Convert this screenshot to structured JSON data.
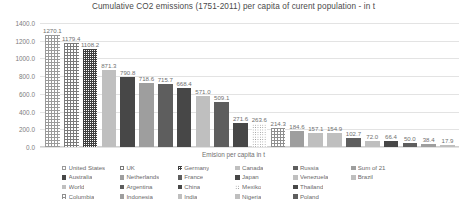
{
  "chart_data": {
    "type": "bar",
    "title": "Cumulative CO2 emissions (1751-2011) per capita of curent population - in t",
    "xlabel": "Emision per capita in t",
    "ylabel": "",
    "ylim": [
      0,
      1400
    ],
    "ytick_step": 200,
    "grid": true,
    "legend_position": "bottom",
    "ytick_labels": [
      "1400.0",
      "1200.0",
      "1000.0",
      "800.0",
      "600.0",
      "400.0",
      "200.0",
      "0.0"
    ],
    "categories": [
      "United States",
      "UK",
      "Germany",
      "Canada",
      "Australia",
      "Netherlands",
      "France",
      "Japan",
      "World",
      "Argentina",
      "China",
      "Mexiko",
      "Columbia",
      "Indonesia",
      "India",
      "Nigeria",
      "Russia",
      "Venezuela",
      "Thailand",
      "Poland",
      "Sum of 21",
      "Brazil"
    ],
    "values": [
      1270.1,
      1179.4,
      1108.2,
      871.3,
      790.8,
      718.6,
      715.7,
      668.4,
      571.0,
      509.1,
      271.6,
      263.6,
      214.3,
      184.6,
      157.1,
      154.9,
      102.7,
      72.0,
      66.4,
      50.0,
      38.4,
      17.9
    ],
    "bars": [
      {
        "label": "1270.1",
        "value": 1270.1,
        "fill": "f-grid-light"
      },
      {
        "label": "1179.4",
        "value": 1179.4,
        "fill": "f-grid-mid"
      },
      {
        "label": "1108.2",
        "value": 1108.2,
        "fill": "f-grid-dark"
      },
      {
        "label": "871.3",
        "value": 871.3,
        "fill": "f-solid-light"
      },
      {
        "label": "790.8",
        "value": 790.8,
        "fill": "f-solid-xdark"
      },
      {
        "label": "718.6",
        "value": 718.6,
        "fill": "f-solid-mid"
      },
      {
        "label": "715.7",
        "value": 715.7,
        "fill": "f-solid-dark"
      },
      {
        "label": "668.4",
        "value": 668.4,
        "fill": "f-solid-xdark"
      },
      {
        "label": "571.0",
        "value": 571.0,
        "fill": "f-solid-light"
      },
      {
        "label": "509.1",
        "value": 509.1,
        "fill": "f-solid-dark"
      },
      {
        "label": "271.6",
        "value": 271.6,
        "fill": "f-solid-xdark"
      },
      {
        "label": "263.6",
        "value": 263.6,
        "fill": "f-dots"
      },
      {
        "label": "214.3",
        "value": 214.3,
        "fill": "f-grid-fine"
      },
      {
        "label": "184.6",
        "value": 184.6,
        "fill": "f-solid-mid"
      },
      {
        "label": "157.1",
        "value": 157.1,
        "fill": "f-solid-light"
      },
      {
        "label": "154.9",
        "value": 154.9,
        "fill": "f-solid-light"
      },
      {
        "label": "102.7",
        "value": 102.7,
        "fill": "f-solid-dark"
      },
      {
        "label": "72.0",
        "value": 72.0,
        "fill": "f-solid-light"
      },
      {
        "label": "66.4",
        "value": 66.4,
        "fill": "f-solid-xdark"
      },
      {
        "label": "50.0",
        "value": 50.0,
        "fill": "f-solid-dark"
      },
      {
        "label": "38.4",
        "value": 38.4,
        "fill": "f-solid-mid"
      },
      {
        "label": "17.9",
        "value": 17.9,
        "fill": "f-solid-light"
      }
    ],
    "legend": [
      {
        "label": "United States",
        "fill": "f-grid-light"
      },
      {
        "label": "Australia",
        "fill": "f-solid-xdark"
      },
      {
        "label": "World",
        "fill": "f-solid-light"
      },
      {
        "label": "Columbia",
        "fill": "f-grid-fine"
      },
      {
        "label": "UK",
        "fill": "f-grid-mid"
      },
      {
        "label": "Netherlands",
        "fill": "f-solid-mid"
      },
      {
        "label": "Argentina",
        "fill": "f-solid-dark"
      },
      {
        "label": "Indonesia",
        "fill": "f-solid-mid"
      },
      {
        "label": "Germany",
        "fill": "f-grid-dark"
      },
      {
        "label": "France",
        "fill": "f-solid-dark"
      },
      {
        "label": "China",
        "fill": "f-solid-xdark"
      },
      {
        "label": "India",
        "fill": "f-solid-light"
      },
      {
        "label": "Canada",
        "fill": "f-solid-light"
      },
      {
        "label": "Japan",
        "fill": "f-solid-xdark"
      },
      {
        "label": "Mexiko",
        "fill": "f-dots"
      },
      {
        "label": "Nigeria",
        "fill": "f-solid-light"
      },
      {
        "label": "Russia",
        "fill": "f-solid-dark"
      },
      {
        "label": "Venezuela",
        "fill": "f-solid-light"
      },
      {
        "label": "Thailand",
        "fill": "f-solid-xdark"
      },
      {
        "label": "Poland",
        "fill": "f-solid-dark"
      },
      {
        "label": "Sum of 21",
        "fill": "f-solid-mid"
      },
      {
        "label": "Brazil",
        "fill": "f-solid-light"
      }
    ]
  }
}
